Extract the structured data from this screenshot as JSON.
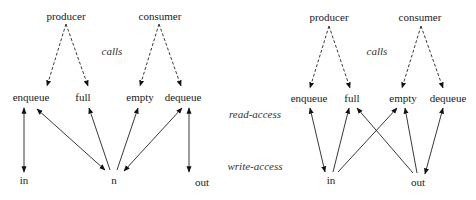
{
  "legend": {
    "calls": "calls",
    "read_access": "read-access",
    "write_access": "write-access"
  },
  "left_diagram": {
    "processes": {
      "producer": "producer",
      "consumer": "consumer"
    },
    "operations": {
      "enqueue": "enqueue",
      "full": "full",
      "empty": "empty",
      "dequeue": "dequeue"
    },
    "variables": {
      "in": "in",
      "n": "n",
      "out": "out"
    }
  },
  "right_diagram": {
    "processes": {
      "producer": "producer",
      "consumer": "consumer"
    },
    "operations": {
      "enqueue": "enqueue",
      "full": "full",
      "empty": "empty",
      "dequeue": "dequeue"
    },
    "variables": {
      "in": "in",
      "out": "out"
    }
  }
}
